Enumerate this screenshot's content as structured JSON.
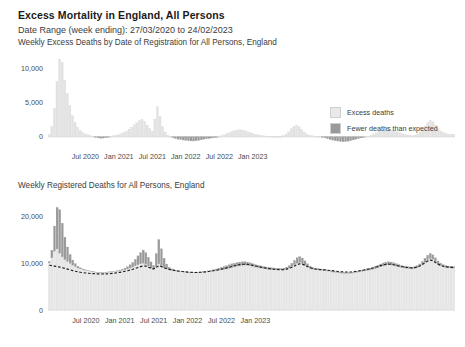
{
  "header": {
    "title": "Excess Mortality in England, All Persons",
    "date_range": "Date Range (week ending): 27/03/2020 to 24/02/2023"
  },
  "chart_data": [
    {
      "id": "excess-deaths",
      "type": "bar",
      "title": "Weekly Excess Deaths by Date of Registration for All Persons, England",
      "xlabel": "",
      "ylabel": "",
      "ylim": [
        -1200,
        12000
      ],
      "yticks": [
        0,
        5000,
        10000
      ],
      "ytick_labels": [
        "0",
        "5,000",
        "10,000"
      ],
      "xticks": [
        "Jul 2020",
        "Jan 2021",
        "Jul 2021",
        "Jan 2022",
        "Jul 2022",
        "Jan 2023"
      ],
      "xtick_positions": [
        14,
        27,
        40,
        53,
        66,
        79
      ],
      "grid": false,
      "legend_position": "right",
      "legend": [
        {
          "label": "Excess deaths",
          "color": "#e9e9e9"
        },
        {
          "label": "Fewer deaths than expected",
          "color": "#9a9a9a"
        }
      ],
      "colors": {
        "positive": "#e3e3e3",
        "negative": "#9a9a9a"
      },
      "values": [
        350,
        1500,
        4200,
        8100,
        11400,
        10900,
        8300,
        6400,
        4600,
        3100,
        2100,
        1400,
        900,
        600,
        420,
        300,
        180,
        60,
        -60,
        -150,
        -220,
        -180,
        -110,
        -40,
        60,
        140,
        220,
        330,
        470,
        640,
        860,
        1130,
        1420,
        1760,
        2100,
        2380,
        2560,
        2240,
        1700,
        1200,
        820,
        2600,
        4400,
        3000,
        1500,
        700,
        260,
        60,
        -120,
        -260,
        -340,
        -400,
        -470,
        -520,
        -560,
        -600,
        -620,
        -580,
        -520,
        -440,
        -360,
        -300,
        -250,
        -180,
        -120,
        -60,
        40,
        160,
        300,
        460,
        620,
        780,
        900,
        980,
        1020,
        980,
        880,
        740,
        600,
        480,
        380,
        300,
        220,
        160,
        120,
        80,
        60,
        40,
        30,
        20,
        60,
        180,
        420,
        760,
        1180,
        1540,
        1680,
        1480,
        1100,
        700,
        400,
        240,
        160,
        100,
        60,
        40,
        -40,
        -140,
        -260,
        -380,
        -480,
        -560,
        -620,
        -680,
        -720,
        -700,
        -640,
        -560,
        -460,
        -360,
        -260,
        -160,
        -80,
        20,
        120,
        260,
        420,
        600,
        800,
        980,
        1120,
        1200,
        1160,
        1040,
        880,
        720,
        580,
        460,
        360,
        280,
        220,
        180,
        260,
        420,
        700,
        1100,
        1600,
        2100,
        2400,
        2200,
        1700,
        1200,
        860,
        620,
        480,
        400,
        360,
        340
      ]
    },
    {
      "id": "registered-deaths",
      "type": "bar-stacked",
      "title": "Weekly Registered Deaths for All Persons, England",
      "xlabel": "",
      "ylabel": "",
      "ylim": [
        0,
        24000
      ],
      "yticks": [
        0,
        10000,
        20000
      ],
      "ytick_labels": [
        "0",
        "10,000",
        "20,000"
      ],
      "xticks": [
        "Jul 2020",
        "Jan 2021",
        "Jul 2021",
        "Jan 2022",
        "Jul 2022",
        "Jan 2023"
      ],
      "xtick_positions": [
        14,
        27,
        40,
        53,
        66,
        79
      ],
      "grid": false,
      "legend_position": "right",
      "legend": [
        {
          "label": "Expected deaths had the pandemic not occurred",
          "type": "dashed-line",
          "color": "#1e1e1e"
        },
        {
          "label": "COVID-19 mentioned on death certificate",
          "type": "swatch",
          "color": "#9a9a9a"
        },
        {
          "label": "COVID-19 not mentioned",
          "type": "swatch",
          "color": "#ebebeb"
        }
      ],
      "colors": {
        "covid_not_mentioned": "#e6e6e6",
        "covid_mentioned": "#9a9a9a",
        "expected_line": "#1e1e1e"
      },
      "series": [
        {
          "name": "COVID-19 not mentioned",
          "values": [
            10100,
            11200,
            12600,
            13100,
            12200,
            11400,
            10800,
            10400,
            10000,
            9600,
            9300,
            9000,
            8800,
            8650,
            8500,
            8400,
            8300,
            8200,
            8100,
            8050,
            8000,
            8050,
            8100,
            8150,
            8200,
            8250,
            8300,
            8400,
            8500,
            8650,
            8800,
            9000,
            9200,
            9450,
            9700,
            9900,
            10050,
            9800,
            9400,
            9000,
            8700,
            9200,
            9900,
            9500,
            9100,
            8800,
            8600,
            8500,
            8400,
            8300,
            8250,
            8200,
            8150,
            8100,
            8080,
            8050,
            8030,
            8060,
            8100,
            8150,
            8200,
            8250,
            8300,
            8380,
            8450,
            8520,
            8600,
            8700,
            8800,
            8950,
            9100,
            9250,
            9400,
            9500,
            9600,
            9650,
            9600,
            9500,
            9350,
            9200,
            9100,
            9000,
            8900,
            8820,
            8760,
            8700,
            8660,
            8630,
            8610,
            8600,
            8650,
            8780,
            9000,
            9300,
            9700,
            10050,
            10200,
            10000,
            9600,
            9200,
            8900,
            8740,
            8650,
            8580,
            8540,
            8520,
            8440,
            8340,
            8230,
            8120,
            8030,
            7960,
            7900,
            7850,
            7820,
            7840,
            7900,
            7980,
            8080,
            8180,
            8280,
            8380,
            8470,
            8580,
            8710,
            8870,
            9050,
            9250,
            9430,
            9580,
            9670,
            9640,
            9530,
            9380,
            9230,
            9110,
            9010,
            8930,
            8870,
            8830,
            8910,
            9070,
            9350,
            9750,
            10250,
            10750,
            11050,
            10850,
            10350,
            9850,
            9500,
            9260,
            9120,
            9040,
            9000,
            8980
          ]
        },
        {
          "name": "COVID-19 mentioned on death certificate",
          "values": [
            300,
            1600,
            5400,
            8900,
            9300,
            7200,
            4800,
            3100,
            1900,
            1100,
            650,
            380,
            230,
            150,
            100,
            70,
            50,
            40,
            35,
            30,
            28,
            30,
            35,
            45,
            60,
            80,
            110,
            160,
            230,
            330,
            480,
            700,
            1000,
            1400,
            1900,
            2400,
            2800,
            2500,
            1900,
            1300,
            850,
            2900,
            5200,
            3600,
            2000,
            1050,
            550,
            300,
            180,
            120,
            90,
            70,
            60,
            55,
            50,
            48,
            46,
            48,
            55,
            70,
            95,
            130,
            180,
            250,
            340,
            440,
            540,
            630,
            700,
            750,
            780,
            790,
            780,
            760,
            730,
            700,
            660,
            620,
            580,
            540,
            500,
            470,
            440,
            410,
            390,
            370,
            350,
            340,
            330,
            325,
            340,
            400,
            520,
            700,
            930,
            1150,
            1250,
            1150,
            930,
            700,
            520,
            400,
            330,
            290,
            260,
            240,
            225,
            215,
            205,
            200,
            195,
            190,
            185,
            180,
            178,
            180,
            190,
            205,
            225,
            250,
            280,
            315,
            355,
            400,
            450,
            505,
            560,
            610,
            650,
            670,
            665,
            640,
            600,
            550,
            500,
            455,
            420,
            395,
            375,
            360,
            380,
            430,
            520,
            650,
            820,
            980,
            1060,
            980,
            820,
            660,
            540,
            460,
            410,
            380,
            360,
            350
          ]
        }
      ],
      "expected_line": [
        9600,
        9500,
        9400,
        9300,
        9200,
        9050,
        8900,
        8750,
        8600,
        8450,
        8300,
        8180,
        8080,
        8000,
        7930,
        7870,
        7820,
        7780,
        7750,
        7730,
        7720,
        7730,
        7750,
        7790,
        7840,
        7900,
        7980,
        8070,
        8170,
        8290,
        8420,
        8570,
        8730,
        8910,
        9100,
        9290,
        9460,
        9400,
        9150,
        8950,
        8800,
        9100,
        9500,
        9300,
        9050,
        8850,
        8700,
        8580,
        8480,
        8390,
        8310,
        8240,
        8180,
        8130,
        8090,
        8060,
        8040,
        8050,
        8080,
        8120,
        8180,
        8250,
        8330,
        8420,
        8520,
        8630,
        8750,
        8880,
        9020,
        9170,
        9330,
        9490,
        9620,
        9720,
        9790,
        9810,
        9770,
        9680,
        9560,
        9430,
        9300,
        9180,
        9070,
        8970,
        8880,
        8800,
        8740,
        8690,
        8650,
        8630,
        8660,
        8760,
        8930,
        9160,
        9440,
        9720,
        9900,
        9830,
        9580,
        9300,
        9060,
        8890,
        8780,
        8700,
        8640,
        8600,
        8560,
        8510,
        8450,
        8380,
        8310,
        8250,
        8200,
        8160,
        8140,
        8150,
        8190,
        8250,
        8330,
        8420,
        8520,
        8620,
        8730,
        8850,
        8990,
        9150,
        9320,
        9500,
        9660,
        9780,
        9840,
        9810,
        9710,
        9570,
        9430,
        9310,
        9210,
        9130,
        9070,
        9030,
        9090,
        9220,
        9440,
        9750,
        10120,
        10480,
        10680,
        10560,
        10200,
        9830,
        9560,
        9370,
        9250,
        9180,
        9140,
        9120
      ]
    }
  ]
}
